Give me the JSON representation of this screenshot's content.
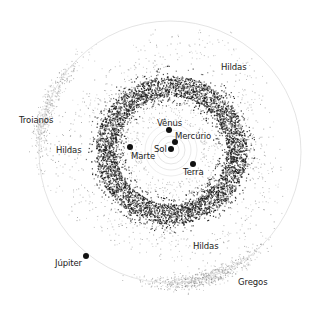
{
  "diagram": {
    "title": "",
    "center": {
      "x": 171,
      "y": 150
    },
    "jupiter_orbit": {
      "cx": 170,
      "cy": 152,
      "r": 131,
      "color": "#dddddd"
    },
    "inner_orbits": [
      {
        "r": 8,
        "color": "#cccccc"
      },
      {
        "r": 14,
        "color": "#d4d4d4"
      },
      {
        "r": 20,
        "color": "#dadada"
      },
      {
        "r": 26,
        "color": "#e0e0e0"
      }
    ],
    "main_belt": {
      "inner_r": 46,
      "outer_r": 82,
      "core_inner_r": 54,
      "core_outer_r": 74,
      "density": 5200,
      "color": "#1a1a1a"
    },
    "hildas": {
      "r_min": 88,
      "r_max": 118,
      "density": 700,
      "color": "#555555"
    },
    "trojans": [
      {
        "name": "Troianos",
        "angle_deg": 200,
        "spread_deg": 45,
        "density": 450,
        "color": "#888888"
      },
      {
        "name": "Gregos",
        "angle_deg": 75,
        "spread_deg": 45,
        "density": 650,
        "color": "#777777"
      }
    ],
    "bodies": [
      {
        "name": "Sol",
        "x": 171,
        "y": 149,
        "label_x": 154,
        "label_y": 145
      },
      {
        "name": "Mercúrio",
        "x": 175,
        "y": 142,
        "label_x": 175,
        "label_y": 132
      },
      {
        "name": "Vênus",
        "x": 169,
        "y": 130,
        "label_x": 157,
        "label_y": 119
      },
      {
        "name": "Marte",
        "x": 130,
        "y": 147,
        "label_x": 131,
        "label_y": 152
      },
      {
        "name": "Terra",
        "x": 193,
        "y": 164,
        "label_x": 183,
        "label_y": 168
      },
      {
        "name": "Júpiter",
        "x": 86,
        "y": 256,
        "label_x": 55,
        "label_y": 259
      }
    ],
    "region_labels": [
      {
        "name": "Hildas",
        "x": 221,
        "y": 63
      },
      {
        "name": "Troianos",
        "x": 19,
        "y": 116
      },
      {
        "name": "Hildas",
        "x": 56,
        "y": 146
      },
      {
        "name": "Hildas",
        "x": 193,
        "y": 242
      },
      {
        "name": "Gregos",
        "x": 238,
        "y": 278
      }
    ]
  }
}
